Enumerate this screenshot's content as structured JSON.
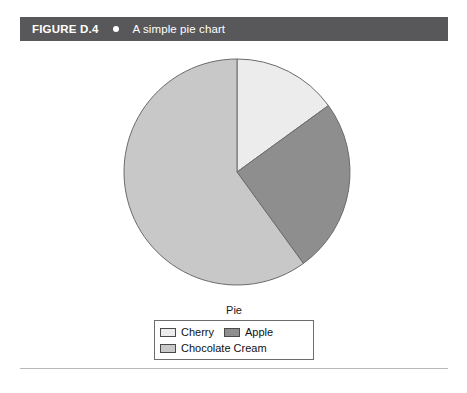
{
  "figure": {
    "number": "FIGURE D.4",
    "bullet": "bullet-dot",
    "caption": "A simple pie chart",
    "header_bg": "#58585a",
    "header_fg": "#ffffff"
  },
  "chart_data": {
    "type": "pie",
    "title": "",
    "legend_title": "Pie",
    "legend_position": "bottom",
    "start_angle_deg": 0,
    "direction": "clockwise",
    "categories": [
      "Cherry",
      "Apple",
      "Chocolate Cream"
    ],
    "values": [
      15,
      25,
      60
    ],
    "unit": "percent",
    "colors": [
      "#ececec",
      "#8e8e8e",
      "#c8c8c8"
    ],
    "slice_border": "#6b6b6b",
    "slices": [
      {
        "label": "Cherry",
        "value": 15,
        "color": "#ececec",
        "start_deg": 0,
        "end_deg": 54
      },
      {
        "label": "Apple",
        "value": 25,
        "color": "#8e8e8e",
        "start_deg": 54,
        "end_deg": 144
      },
      {
        "label": "Chocolate Cream",
        "value": 60,
        "color": "#c8c8c8",
        "start_deg": 144,
        "end_deg": 360
      }
    ],
    "grid": false,
    "xlabel": "",
    "ylabel": ""
  },
  "legend": {
    "title": "Pie",
    "rows": [
      [
        {
          "label": "Cherry",
          "color": "#ececec"
        },
        {
          "label": "Apple",
          "color": "#8e8e8e"
        }
      ],
      [
        {
          "label": "Chocolate Cream",
          "color": "#c8c8c8"
        }
      ]
    ]
  },
  "rule": {
    "color": "#b9b9b9"
  }
}
